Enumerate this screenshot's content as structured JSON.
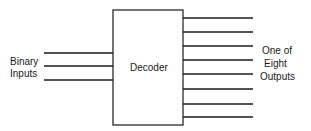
{
  "diagram": {
    "block": {
      "label": "Decoder"
    },
    "inputs": {
      "label_line1": "Binary",
      "label_line2": "Inputs",
      "count": 3
    },
    "outputs": {
      "label_line1": "One of",
      "label_line2": "Eight",
      "label_line3": "Outputs",
      "count": 8
    },
    "colors": {
      "stroke": "#1a1a1a",
      "background": "#ffffff"
    }
  }
}
